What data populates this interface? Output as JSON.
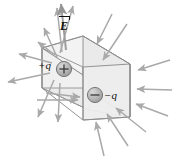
{
  "figure": {
    "type": "physics-diagram",
    "width": 178,
    "height": 160,
    "background_color": "#ffffff"
  },
  "labels": {
    "field_vector": "E",
    "field_vector_full": "E⃗",
    "positive_charge": "+q",
    "negative_charge": "−q"
  },
  "charges": [
    {
      "name": "positive-charge",
      "label": "+q",
      "sign": "+",
      "sphere_fill": "#b6b6b6",
      "sphere_stroke": "#6e6e6e",
      "cx": 64,
      "cy": 69,
      "r": 7.5
    },
    {
      "name": "negative-charge",
      "label": "−q",
      "sign": "−",
      "sphere_fill": "#b6b6b6",
      "sphere_stroke": "#6e6e6e",
      "cx": 95,
      "cy": 95,
      "r": 7.5
    }
  ],
  "surface": {
    "name": "gaussian-box",
    "shape": "parallelepiped",
    "face_fill": "#efefef",
    "face_fill_dark": "#e3e3e3",
    "edge_color": "#8d8d8d",
    "hidden_edge_style": "dashed"
  },
  "field_arrows": {
    "color": "#a9a9a9",
    "outward_count": 10,
    "inward_count": 10,
    "description": "Field lines diverge from +q and converge on −q"
  },
  "colors": {
    "text": "#111111",
    "arrow": "#a9a9a9",
    "edge": "#8d8d8d",
    "face_light": "#efefef",
    "face_dark": "#e3e3e3",
    "sphere": "#b6b6b6"
  }
}
